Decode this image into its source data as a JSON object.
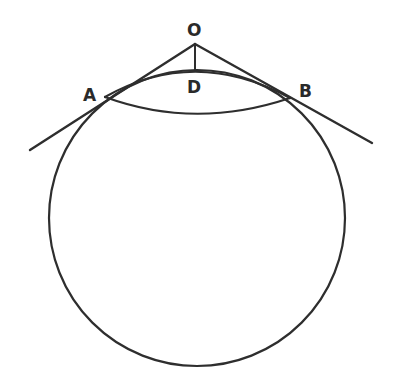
{
  "diagram": {
    "type": "geometry",
    "labels": {
      "O": "O",
      "D": "D",
      "A": "A",
      "B": "B"
    },
    "colors": {
      "ink": "#2e2e2e",
      "background": "#ffffff"
    },
    "geometry": {
      "circle": {
        "cx": 197,
        "cy": 218,
        "r": 148
      },
      "O": [
        195,
        44
      ],
      "A": [
        105,
        97
      ],
      "B": [
        290,
        98
      ],
      "D": [
        195,
        70
      ],
      "tangent_left_end": [
        30,
        150
      ],
      "tangent_right_end": [
        372,
        143
      ]
    }
  }
}
